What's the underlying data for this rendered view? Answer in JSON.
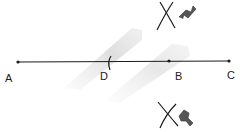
{
  "diagram": {
    "title": "",
    "points": [
      {
        "id": "A",
        "label": "A"
      },
      {
        "id": "D",
        "label": "D"
      },
      {
        "id": "B",
        "label": "B"
      },
      {
        "id": "C",
        "label": "C"
      }
    ],
    "segment": {
      "from": "A",
      "to": "C"
    },
    "arc_mark_at": "D",
    "intersection_marks": [
      {
        "position": "above",
        "near": "B",
        "arrow": true
      },
      {
        "position": "below",
        "near": "B",
        "arrow": true
      }
    ],
    "colors": {
      "ink": "#1c1c1c",
      "arrow": "#555555",
      "smudge": "#d4d4d4"
    }
  }
}
